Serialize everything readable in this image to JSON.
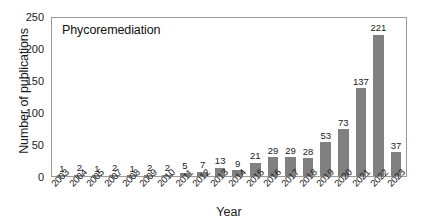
{
  "chart_data": {
    "type": "bar",
    "title": "Phycoremediation",
    "xlabel": "Year",
    "ylabel": "Number of publications",
    "categories": [
      "2003",
      "2004",
      "2005",
      "2007",
      "2008",
      "2009",
      "2010",
      "2011",
      "2012",
      "2013",
      "2014",
      "2015",
      "2016",
      "2017",
      "2018",
      "2019",
      "2020",
      "2021",
      "2022",
      "2023"
    ],
    "values": [
      1,
      2,
      1,
      2,
      1,
      2,
      2,
      5,
      7,
      13,
      9,
      21,
      29,
      29,
      28,
      53,
      73,
      137,
      221,
      37
    ],
    "ylim": [
      0,
      250
    ],
    "yticks": [
      "0",
      "50",
      "100",
      "150",
      "200",
      "250"
    ],
    "ytick_values": [
      0,
      50,
      100,
      150,
      200,
      250
    ],
    "grid": false,
    "legend": null,
    "bar_color": "#808080",
    "axis_color": "#9a9a9a",
    "text_color": "#1a1a1a",
    "show_value_labels": true
  }
}
